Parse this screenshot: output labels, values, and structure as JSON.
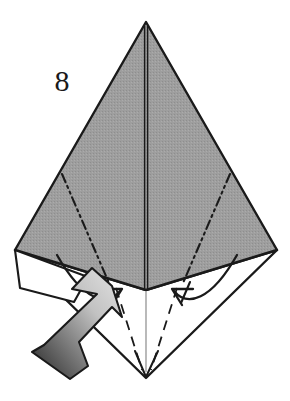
{
  "figure": {
    "kind": "origami-fold-diagram",
    "step_number": "8",
    "step_number_position": {
      "x": 62,
      "y": 84
    },
    "canvas": {
      "width": 290,
      "height": 401
    },
    "background_color": "#ffffff"
  },
  "colors": {
    "paper_front_gray": "#9a9a9a",
    "paper_back_white": "#ffffff",
    "outline_black": "#1a1a1a",
    "crease_line": "#1a1a1a",
    "thin_line": "#555555",
    "arrow_gradient_light": "#d8d8d8",
    "arrow_gradient_dark": "#2e2e2e",
    "arrow_outline": "#1a1a1a"
  },
  "shapes": {
    "gray_kite": {
      "name": "upper-gray-triangle",
      "points": "146,22 277,250 146,290 15,250",
      "fill": "#9a9a9a",
      "stroke": "#1a1a1a",
      "stroke_width": 2.4
    },
    "white_kite": {
      "name": "lower-white-diamond",
      "points": "15,250 146,290 277,250 146,378",
      "fill": "#ffffff",
      "stroke": "#1a1a1a",
      "stroke_width": 2.4
    },
    "left_white_flap": {
      "name": "left-white-flap",
      "points": "15,250 86,278 68,300 22,288",
      "fill": "#ffffff",
      "stroke": "#1a1a1a",
      "stroke_width": 2.0
    }
  },
  "lines": {
    "center_vertical_upper": {
      "name": "center-crease-upper",
      "x1": 146,
      "y1": 24,
      "x2": 146,
      "y2": 290,
      "style": "solid-double",
      "stroke": "#1a1a1a",
      "stroke_width": 2.2
    },
    "center_vertical_lower": {
      "name": "center-crease-lower",
      "x1": 146,
      "y1": 292,
      "x2": 146,
      "y2": 372,
      "style": "thin-solid",
      "stroke": "#777777",
      "stroke_width": 1.0
    },
    "dashdot_left": {
      "name": "dash-dot-fold-left",
      "x1": 62,
      "y1": 174,
      "x2": 108,
      "y2": 282,
      "style": "dash-dot-dot",
      "stroke": "#1a1a1a",
      "stroke_width": 2.0,
      "dasharray": "9,4,2,4,2,4"
    },
    "dashdot_right": {
      "name": "dash-dot-fold-right",
      "x1": 230,
      "y1": 174,
      "x2": 184,
      "y2": 282,
      "style": "dash-dot-dot",
      "stroke": "#1a1a1a",
      "stroke_width": 2.0,
      "dasharray": "9,4,2,4,2,4"
    },
    "valley_left": {
      "name": "valley-fold-left",
      "x1": 116,
      "y1": 288,
      "x2": 143,
      "y2": 372,
      "style": "dashed",
      "stroke": "#1a1a1a",
      "stroke_width": 1.8,
      "dasharray": "10,7"
    },
    "valley_right": {
      "name": "valley-fold-right",
      "x1": 177,
      "y1": 288,
      "x2": 150,
      "y2": 372,
      "style": "dashed",
      "stroke": "#1a1a1a",
      "stroke_width": 1.8,
      "dasharray": "10,7"
    },
    "flap_edge_left": {
      "name": "left-flap-edge",
      "x1": 15,
      "y1": 250,
      "x2": 86,
      "y2": 278,
      "style": "solid",
      "stroke": "#1a1a1a",
      "stroke_width": 2.0
    }
  },
  "arrows": {
    "curved_left": {
      "name": "curved-fold-arrow-left",
      "path": "M 58,256 C 84,300 106,306 118,292",
      "head_at": {
        "x": 118,
        "y": 292
      },
      "head_angle_deg": -40,
      "stroke": "#1a1a1a",
      "stroke_width": 2.2,
      "direction": "inward-up-right"
    },
    "curved_right": {
      "name": "curved-fold-arrow-right",
      "path": "M 236,256 C 210,300 188,306 176,292",
      "head_at": {
        "x": 176,
        "y": 292
      },
      "head_angle_deg": 220,
      "stroke": "#1a1a1a",
      "stroke_width": 2.2,
      "direction": "inward-up-left"
    },
    "block_arrow": {
      "name": "push-block-arrow",
      "points": "88,272 72,288 96,292 42,344 30,352 68,376 86,364 78,340 108,310 118,318 108,288",
      "gradient_from": "#e2e2e2",
      "gradient_to": "#2a2a2a",
      "stroke": "#1a1a1a",
      "stroke_width": 2.0,
      "direction": "up-right",
      "meaning": "push/fold-this-flap"
    },
    "bottom_tip_chevron": {
      "name": "bottom-tip-arrow",
      "path": "M 136,352 L 146,376 L 157,352",
      "stroke": "#1a1a1a",
      "stroke_width": 2.0
    }
  },
  "labels": {
    "step": "8"
  }
}
